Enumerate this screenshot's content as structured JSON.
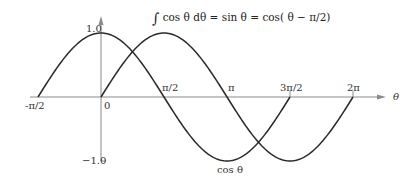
{
  "chart_data": {
    "type": "line",
    "title": "",
    "formula": "∫ cos θ dθ = sin θ = cos( θ − π/2)",
    "xlabel": "θ",
    "ylabel": "",
    "x_tick_labels": [
      "-π/2",
      "0",
      "π/2",
      "π",
      "3π/2",
      "2π"
    ],
    "x_tick_values": [
      -1.5708,
      0,
      1.5708,
      3.1416,
      4.7124,
      6.2832
    ],
    "y_tick_labels": [
      "1.0",
      "-1.0"
    ],
    "y_tick_values": [
      1.0,
      -1.0
    ],
    "ylim": [
      -1.0,
      1.0
    ],
    "xlim": [
      -1.5708,
      6.2832
    ],
    "grid": false,
    "series": [
      {
        "name": "cos θ",
        "function": "cos",
        "x_range": [
          -1.5708,
          4.7124
        ],
        "points": [
          [
            -1.5708,
            0
          ],
          [
            0,
            1
          ],
          [
            1.5708,
            0
          ],
          [
            3.1416,
            -1
          ],
          [
            4.7124,
            0
          ]
        ]
      },
      {
        "name": "sin θ",
        "function": "sin",
        "x_range": [
          0,
          6.2832
        ],
        "points": [
          [
            0,
            0
          ],
          [
            1.5708,
            1
          ],
          [
            3.1416,
            0
          ],
          [
            4.7124,
            -1
          ],
          [
            6.2832,
            0
          ]
        ]
      }
    ],
    "annotations": [
      {
        "text": "∫ cos θ dθ = sin θ = cos( θ − π/2)",
        "position": "top-center"
      },
      {
        "text": "cos θ",
        "position": "below trough of cos curve at θ=π"
      }
    ]
  },
  "labels": {
    "formula_integral": "∫",
    "formula_body": "cos θ dθ  = sin θ = cos( θ − π/2)",
    "y_max": "1.0",
    "y_min": "−1.0",
    "x_neg_half_pi": "-π/2",
    "x_zero": "0",
    "x_half_pi": "π/2",
    "x_pi": "π",
    "x_three_half_pi": "3π/2",
    "x_two_pi": "2π",
    "axis_theta": "θ",
    "curve_cos": "cos θ"
  },
  "colors": {
    "curve": "#2a2a2a",
    "axis": "#8a8a8a",
    "text": "#333333"
  }
}
